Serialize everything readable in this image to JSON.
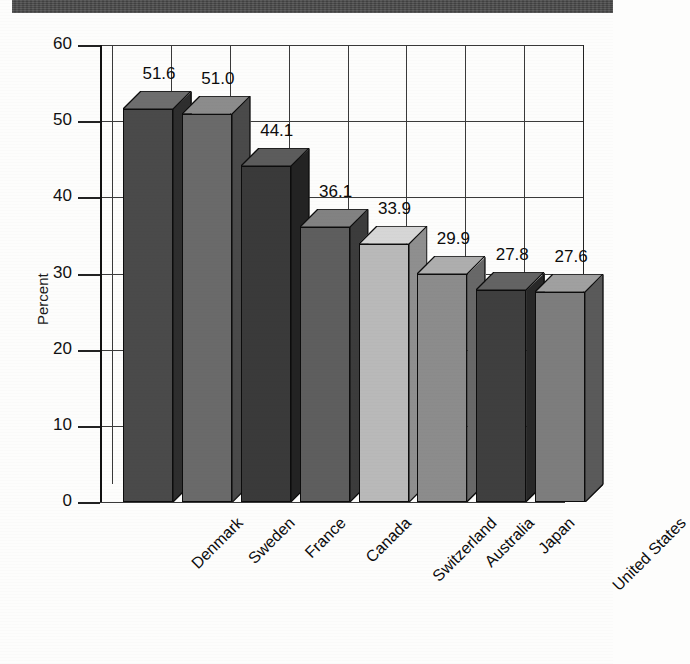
{
  "page": {
    "background_color": "#fdfdfc",
    "scan_band_color": "#4a4a4a"
  },
  "chart_data": {
    "type": "bar",
    "title": "",
    "subtitle": "",
    "xlabel": "",
    "ylabel": "Percent",
    "categories": [
      "Denmark",
      "Sweden",
      "France",
      "Canada",
      "Switzerland",
      "Australia",
      "Japan",
      "United States"
    ],
    "values": [
      51.6,
      51.0,
      44.1,
      36.1,
      33.9,
      29.9,
      27.8,
      27.6
    ],
    "value_labels": [
      "51.6",
      "51.0",
      "44.1",
      "36.1",
      "33.9",
      "29.9",
      "27.8",
      "27.6"
    ],
    "ylim": [
      0,
      60
    ],
    "yticks": [
      0,
      10,
      20,
      30,
      40,
      50,
      60
    ],
    "ytick_labels": [
      "0",
      "10",
      "20",
      "30",
      "40",
      "50",
      "60"
    ],
    "grid": true,
    "legend": null,
    "legend_position": "none",
    "style_3d": true,
    "bar_colors": [
      "#4a4a4a",
      "#6a6a6a",
      "#3a3a3a",
      "#5e5e5e",
      "#b9b9b9",
      "#8c8c8c",
      "#3f3f3f",
      "#7d7d7d"
    ],
    "bar_top_colors": [
      "#6e6e6e",
      "#8c8c8c",
      "#5c5c5c",
      "#828282",
      "#d6d6d6",
      "#aeaeae",
      "#636363",
      "#a0a0a0"
    ],
    "bar_side_colors": [
      "#2e2e2e",
      "#4a4a4a",
      "#232323",
      "#3c3c3c",
      "#8f8f8f",
      "#686868",
      "#282828",
      "#5a5a5a"
    ]
  },
  "axes": {
    "y_axis_title": "Percent"
  }
}
